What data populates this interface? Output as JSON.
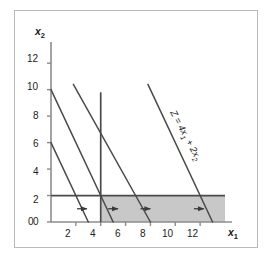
{
  "figure": {
    "kind": "linear-programming-graph",
    "background": "#ffffff",
    "frame_color": "#b9b9bd"
  },
  "axes": {
    "x_axis_label": "x",
    "x_axis_sub": "1",
    "y_axis_label": "x",
    "y_axis_sub": "2",
    "x_ticks": [
      2,
      4,
      6,
      8,
      10,
      12
    ],
    "y_ticks": [
      0,
      2,
      4,
      6,
      8,
      10,
      12
    ],
    "xlim": [
      0,
      14
    ],
    "ylim": [
      0,
      13.6
    ],
    "axis_color": "#8c8c90",
    "tick_text_color": "#222222"
  },
  "annotations": {
    "z_label_text": "Z = 4x",
    "z_label_sub1": "1",
    "z_label_mid": " + 2x",
    "z_label_sub2": "2",
    "z_label_full": "Z = 4x1 + 2x2"
  },
  "chart_data": {
    "type": "line",
    "title": "",
    "xlabel": "x1",
    "ylabel": "x2",
    "xlim": [
      0,
      14
    ],
    "ylim": [
      0,
      13.6
    ],
    "grid": false,
    "legend": "none",
    "objective_function": "Z = 4x1 + 2x2",
    "objective_slope": -2,
    "series": [
      {
        "name": "iso-profit line Z=12",
        "kind": "objective-contour",
        "points": [
          [
            0,
            6
          ],
          [
            3,
            0
          ]
        ],
        "x_intercept": 3,
        "y_intercept": 6,
        "color": "#4a4a4a"
      },
      {
        "name": "iso-profit line Z=20",
        "kind": "objective-contour",
        "points": [
          [
            0,
            10
          ],
          [
            5,
            0
          ]
        ],
        "x_intercept": 5,
        "y_intercept": 10,
        "color": "#4a4a4a"
      },
      {
        "name": "iso-profit line Z=32",
        "kind": "objective-contour",
        "points": [
          [
            1.8,
            10.4
          ],
          [
            8,
            0
          ]
        ],
        "x_intercept": 8,
        "y_intercept": 16,
        "color": "#4a4a4a"
      },
      {
        "name": "iso-profit line Z=52",
        "kind": "objective-contour",
        "points": [
          [
            7.8,
            10.4
          ],
          [
            13,
            0
          ]
        ],
        "x_intercept": 13,
        "y_intercept": 26,
        "color": "#4a4a4a"
      }
    ],
    "constraints": [
      {
        "name": "vertical constraint x1 = 4",
        "type": "vertical",
        "value": 4,
        "from_y": 0,
        "to_y": 9.8,
        "color": "#4a4a4a"
      },
      {
        "name": "horizontal constraint x2 = 2",
        "type": "horizontal",
        "value": 2,
        "from_x": 0,
        "to_x": 14,
        "color": "#4a4a4a"
      }
    ],
    "shaded_region": {
      "name": "feasible region",
      "x_from": 4,
      "x_to": 14,
      "y_from": 0,
      "y_to": 2,
      "fill": "#c8c8c8"
    },
    "direction_arrows": [
      {
        "x_start": 2.1,
        "x_end": 3.3,
        "y": 1.0
      },
      {
        "x_start": 4.6,
        "x_end": 5.8,
        "y": 1.0
      },
      {
        "x_start": 7.2,
        "x_end": 8.4,
        "y": 1.0
      },
      {
        "x_start": 11.5,
        "x_end": 12.7,
        "y": 1.0
      }
    ]
  }
}
